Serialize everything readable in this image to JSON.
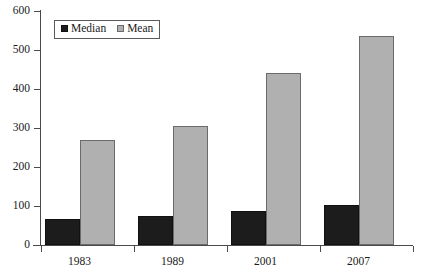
{
  "chart_data": {
    "type": "bar",
    "title": "",
    "xlabel": "",
    "ylabel": "",
    "categories": [
      "1983",
      "1989",
      "2001",
      "2007"
    ],
    "series": [
      {
        "name": "Median",
        "color": "#1c1c1c",
        "values": [
          67,
          74,
          87,
          103
        ]
      },
      {
        "name": "Mean",
        "color": "#b0b0b0",
        "values": [
          269,
          305,
          441,
          536
        ]
      }
    ],
    "ylim": [
      0,
      600
    ],
    "yticks": [
      0,
      100,
      200,
      300,
      400,
      500,
      600
    ],
    "ytick_labels": [
      "0",
      "100",
      "200",
      "300",
      "400",
      "500",
      "600"
    ],
    "grid": false,
    "legend": {
      "position": "top-left",
      "entries": [
        {
          "label": "Median",
          "swatch": "median"
        },
        {
          "label": "Mean",
          "swatch": "mean"
        }
      ]
    }
  }
}
